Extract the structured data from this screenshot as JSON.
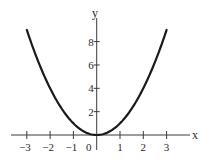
{
  "chart_data": {
    "type": "line",
    "title": "",
    "function": "y = x^2",
    "xlabel": "x",
    "ylabel": "y",
    "xlim": [
      -3.4,
      4.2
    ],
    "ylim": [
      0,
      11
    ],
    "grid": false,
    "legend": null,
    "x_ticks": [
      -3,
      -2,
      -1,
      0,
      1,
      2,
      3
    ],
    "x_tick_labels": [
      "−3",
      "−2",
      "−1",
      "0",
      "1",
      "2",
      "3"
    ],
    "y_ticks": [
      2,
      4,
      6,
      8
    ],
    "y_tick_labels": [
      "2",
      "4",
      "6",
      "8"
    ],
    "series": [
      {
        "name": "y = x^2",
        "x": [
          -3,
          -2.5,
          -2,
          -1.5,
          -1,
          -0.5,
          0,
          0.5,
          1,
          1.5,
          2,
          2.5,
          3
        ],
        "y": [
          9,
          6.25,
          4,
          2.25,
          1,
          0.25,
          0,
          0.25,
          1,
          2.25,
          4,
          6.25,
          9
        ]
      }
    ],
    "colors": {
      "curve": "#1a1a1a",
      "axis": "#3a3a3a",
      "background": "#ffffff"
    }
  }
}
